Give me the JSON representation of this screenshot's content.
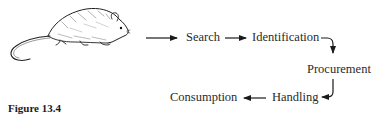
{
  "figure": {
    "caption": "Figure 13.4",
    "illustration": "rat-illustration"
  },
  "flow": {
    "steps": [
      {
        "id": "search",
        "label": "Search"
      },
      {
        "id": "identification",
        "label": "Identification"
      },
      {
        "id": "procurement",
        "label": "Procurement"
      },
      {
        "id": "handling",
        "label": "Handling"
      },
      {
        "id": "consumption",
        "label": "Consumption"
      }
    ],
    "edges": [
      {
        "from": "rat",
        "to": "search"
      },
      {
        "from": "search",
        "to": "identification"
      },
      {
        "from": "identification",
        "to": "procurement"
      },
      {
        "from": "procurement",
        "to": "handling"
      },
      {
        "from": "handling",
        "to": "consumption"
      }
    ]
  },
  "colors": {
    "ink": "#1a1a1a",
    "text": "#2a2a2a",
    "background": "#ffffff"
  }
}
